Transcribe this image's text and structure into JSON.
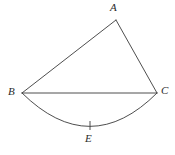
{
  "figure": {
    "background_color": "#ffffff",
    "stroke_color": "#3a3a3a",
    "label_color": "#2b2b2b",
    "stroke_width": 0.9
  },
  "labels": {
    "a": "A",
    "b": "B",
    "c": "C",
    "e": "E"
  },
  "points": {
    "A": {
      "x": 116,
      "y": 20,
      "label": "A",
      "label_x": 110,
      "label_y": 2
    },
    "B": {
      "x": 22,
      "y": 93,
      "label": "B",
      "label_x": 8,
      "label_y": 86
    },
    "C": {
      "x": 157,
      "y": 93,
      "label": "C",
      "label_x": 161,
      "label_y": 85
    },
    "E": {
      "x": 90,
      "y": 126,
      "label": "E",
      "label_x": 85,
      "label_y": 133
    }
  },
  "segments": [
    {
      "name": "side-AB",
      "from": "B",
      "to": "A",
      "path": "M 22 93 L 116 20"
    },
    {
      "name": "side-AC",
      "from": "A",
      "to": "C",
      "path": "M 116 20 L 157 93"
    },
    {
      "name": "chord-BC",
      "from": "B",
      "to": "C",
      "path": "M 22 93 L 157 93"
    }
  ],
  "arcs": [
    {
      "name": "arc-BEC",
      "from": "B",
      "to": "C",
      "through": "E",
      "bulge": "downward",
      "path": "M 22 93 Q 90 160 157 93"
    }
  ],
  "ticks": [
    {
      "name": "tick-mark-E",
      "at": "E",
      "path": "M 90 121 L 90 130"
    }
  ]
}
